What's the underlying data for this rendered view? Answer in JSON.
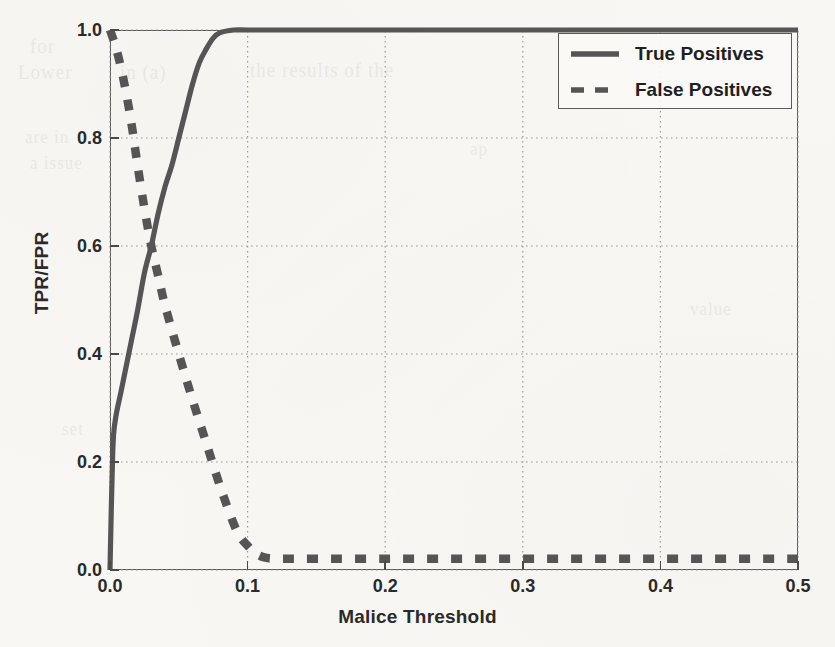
{
  "figure": {
    "background_color": "#f8f7f4",
    "ink_color": "#555555",
    "frame_color": "#5a5a5a",
    "ghost_text": [
      "for",
      "Lower",
      "in  (a)",
      "the  results of the",
      "are in",
      "a issue",
      "ap",
      "set",
      "value"
    ]
  },
  "chart_data": {
    "type": "line",
    "title": "",
    "xlabel": "Malice Threshold",
    "ylabel": "TPR/FPR",
    "xlim": [
      0.0,
      0.5
    ],
    "ylim": [
      0.0,
      1.0
    ],
    "xticks": [
      "0.0",
      "0.1",
      "0.2",
      "0.3",
      "0.4",
      "0.5"
    ],
    "xtick_values": [
      0.0,
      0.1,
      0.2,
      0.3,
      0.4,
      0.5
    ],
    "yticks": [
      "0.0",
      "0.2",
      "0.4",
      "0.6",
      "0.8",
      "1.0"
    ],
    "ytick_values": [
      0.0,
      0.2,
      0.4,
      0.6,
      0.8,
      1.0
    ],
    "grid": true,
    "grid_style": "dotted",
    "legend_position": "top-right-inside",
    "series": [
      {
        "name": "True Positives",
        "style": "solid",
        "color": "#555555",
        "x": [
          0.0,
          0.002,
          0.004,
          0.008,
          0.012,
          0.016,
          0.02,
          0.025,
          0.03,
          0.035,
          0.04,
          0.045,
          0.05,
          0.055,
          0.06,
          0.065,
          0.07,
          0.075,
          0.08,
          0.09,
          0.1,
          0.12,
          0.15,
          0.2,
          0.25,
          0.3,
          0.35,
          0.4,
          0.45,
          0.5
        ],
        "y": [
          0.0,
          0.22,
          0.28,
          0.33,
          0.38,
          0.43,
          0.48,
          0.55,
          0.6,
          0.66,
          0.71,
          0.75,
          0.8,
          0.85,
          0.9,
          0.94,
          0.965,
          0.985,
          0.995,
          1.0,
          1.0,
          1.0,
          1.0,
          1.0,
          1.0,
          1.0,
          1.0,
          1.0,
          1.0,
          1.0
        ]
      },
      {
        "name": "False Positives",
        "style": "dashed",
        "color": "#555555",
        "x": [
          0.0,
          0.004,
          0.008,
          0.012,
          0.016,
          0.02,
          0.025,
          0.03,
          0.035,
          0.04,
          0.05,
          0.06,
          0.07,
          0.08,
          0.09,
          0.095,
          0.1,
          0.105,
          0.11,
          0.115,
          0.12,
          0.15,
          0.2,
          0.25,
          0.3,
          0.35,
          0.4,
          0.45,
          0.5
        ],
        "y": [
          1.0,
          0.97,
          0.93,
          0.88,
          0.82,
          0.75,
          0.67,
          0.6,
          0.545,
          0.49,
          0.4,
          0.315,
          0.235,
          0.155,
          0.085,
          0.06,
          0.045,
          0.032,
          0.025,
          0.022,
          0.021,
          0.021,
          0.021,
          0.021,
          0.021,
          0.021,
          0.021,
          0.021,
          0.021
        ]
      }
    ]
  },
  "legend": {
    "entries": [
      {
        "label": "True Positives",
        "style": "solid"
      },
      {
        "label": "False Positives",
        "style": "dashed"
      }
    ]
  }
}
